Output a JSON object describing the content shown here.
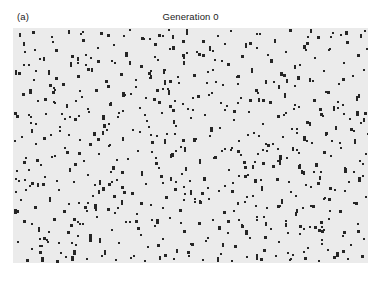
{
  "figure": {
    "width": 379,
    "height": 289,
    "page_background": "#ffffff"
  },
  "header": {
    "panel_label": "(a)",
    "title": "Generation 0"
  },
  "plot": {
    "background": "#ebebeb",
    "marker_color": "#262626",
    "left": 13,
    "top": 28,
    "width": 355,
    "height": 235,
    "border": "none"
  },
  "chart_data": {
    "type": "scatter",
    "title": "Generation 0",
    "subtitle": "(a)",
    "xlabel": "",
    "ylabel": "",
    "grid": false,
    "legend": null,
    "xlim": [
      0,
      355
    ],
    "ylim": [
      0,
      235
    ],
    "axis_visible": false,
    "tick_labels_x": [],
    "tick_labels_y": [],
    "marker": "square",
    "marker_size_px": 2.4,
    "marker_color": "#262626",
    "plot_background": "#ebebeb",
    "point_count": 648,
    "distribution": "uniform-random",
    "seed": 20240117,
    "points": [
      [
        7,
        6
      ],
      [
        20,
        4
      ],
      [
        39,
        9
      ],
      [
        56,
        3
      ],
      [
        70,
        12
      ],
      [
        88,
        5
      ],
      [
        101,
        17
      ],
      [
        117,
        2
      ],
      [
        131,
        11
      ],
      [
        146,
        7
      ],
      [
        160,
        19
      ],
      [
        174,
        4
      ],
      [
        190,
        13
      ],
      [
        205,
        8
      ],
      [
        218,
        3
      ],
      [
        233,
        16
      ],
      [
        247,
        6
      ],
      [
        262,
        12
      ],
      [
        277,
        2
      ],
      [
        291,
        18
      ],
      [
        305,
        9
      ],
      [
        320,
        5
      ],
      [
        334,
        14
      ],
      [
        348,
        7
      ],
      [
        352,
        3
      ],
      [
        12,
        24
      ],
      [
        27,
        31
      ],
      [
        43,
        22
      ],
      [
        58,
        35
      ],
      [
        73,
        27
      ],
      [
        85,
        20
      ],
      [
        99,
        33
      ],
      [
        113,
        25
      ],
      [
        128,
        38
      ],
      [
        142,
        29
      ],
      [
        157,
        21
      ],
      [
        171,
        34
      ],
      [
        186,
        26
      ],
      [
        200,
        23
      ],
      [
        215,
        36
      ],
      [
        229,
        28
      ],
      [
        244,
        20
      ],
      [
        258,
        32
      ],
      [
        273,
        24
      ],
      [
        287,
        37
      ],
      [
        302,
        30
      ],
      [
        316,
        22
      ],
      [
        331,
        35
      ],
      [
        345,
        27
      ],
      [
        354,
        21
      ],
      [
        6,
        45
      ],
      [
        21,
        52
      ],
      [
        36,
        43
      ],
      [
        50,
        56
      ],
      [
        65,
        48
      ],
      [
        79,
        41
      ],
      [
        94,
        54
      ],
      [
        108,
        46
      ],
      [
        123,
        59
      ],
      [
        137,
        50
      ],
      [
        152,
        42
      ],
      [
        166,
        55
      ],
      [
        181,
        47
      ],
      [
        195,
        44
      ],
      [
        210,
        57
      ],
      [
        224,
        49
      ],
      [
        239,
        41
      ],
      [
        253,
        53
      ],
      [
        268,
        45
      ],
      [
        282,
        58
      ],
      [
        297,
        51
      ],
      [
        311,
        43
      ],
      [
        326,
        56
      ],
      [
        340,
        48
      ],
      [
        351,
        42
      ],
      [
        10,
        66
      ],
      [
        25,
        73
      ],
      [
        40,
        64
      ],
      [
        54,
        77
      ],
      [
        69,
        69
      ],
      [
        83,
        62
      ],
      [
        98,
        75
      ],
      [
        112,
        67
      ],
      [
        127,
        80
      ],
      [
        141,
        71
      ],
      [
        156,
        63
      ],
      [
        170,
        76
      ],
      [
        185,
        68
      ],
      [
        199,
        65
      ],
      [
        214,
        78
      ],
      [
        228,
        70
      ],
      [
        243,
        62
      ],
      [
        257,
        74
      ],
      [
        272,
        66
      ],
      [
        286,
        79
      ],
      [
        301,
        72
      ],
      [
        315,
        64
      ],
      [
        330,
        77
      ],
      [
        344,
        69
      ],
      [
        356,
        63
      ],
      [
        4,
        88
      ],
      [
        18,
        95
      ],
      [
        33,
        86
      ],
      [
        47,
        99
      ],
      [
        62,
        91
      ],
      [
        76,
        84
      ],
      [
        91,
        97
      ],
      [
        105,
        89
      ],
      [
        120,
        102
      ],
      [
        134,
        93
      ],
      [
        149,
        85
      ],
      [
        163,
        98
      ],
      [
        178,
        90
      ],
      [
        192,
        87
      ],
      [
        207,
        100
      ],
      [
        221,
        92
      ],
      [
        236,
        84
      ],
      [
        250,
        96
      ],
      [
        265,
        88
      ],
      [
        279,
        101
      ],
      [
        294,
        94
      ],
      [
        308,
        86
      ],
      [
        323,
        99
      ],
      [
        337,
        91
      ],
      [
        352,
        85
      ],
      [
        9,
        109
      ],
      [
        23,
        116
      ],
      [
        38,
        107
      ],
      [
        52,
        120
      ],
      [
        67,
        112
      ],
      [
        81,
        105
      ],
      [
        96,
        118
      ],
      [
        110,
        110
      ],
      [
        125,
        123
      ],
      [
        139,
        114
      ],
      [
        154,
        106
      ],
      [
        168,
        119
      ],
      [
        183,
        111
      ],
      [
        197,
        108
      ],
      [
        212,
        121
      ],
      [
        226,
        113
      ],
      [
        241,
        105
      ],
      [
        255,
        117
      ],
      [
        270,
        109
      ],
      [
        284,
        122
      ],
      [
        299,
        115
      ],
      [
        313,
        107
      ],
      [
        328,
        120
      ],
      [
        342,
        112
      ],
      [
        355,
        106
      ],
      [
        13,
        130
      ],
      [
        28,
        137
      ],
      [
        42,
        128
      ],
      [
        57,
        141
      ],
      [
        71,
        133
      ],
      [
        86,
        126
      ],
      [
        100,
        139
      ],
      [
        115,
        131
      ],
      [
        129,
        144
      ],
      [
        144,
        135
      ],
      [
        158,
        127
      ],
      [
        173,
        140
      ],
      [
        187,
        132
      ],
      [
        202,
        129
      ],
      [
        216,
        142
      ],
      [
        231,
        134
      ],
      [
        245,
        126
      ],
      [
        260,
        138
      ],
      [
        274,
        130
      ],
      [
        289,
        143
      ],
      [
        303,
        136
      ],
      [
        318,
        128
      ],
      [
        332,
        141
      ],
      [
        347,
        133
      ],
      [
        357,
        127
      ],
      [
        3,
        151
      ],
      [
        17,
        158
      ],
      [
        32,
        149
      ],
      [
        46,
        162
      ],
      [
        61,
        154
      ],
      [
        75,
        147
      ],
      [
        90,
        160
      ],
      [
        104,
        152
      ],
      [
        119,
        165
      ],
      [
        133,
        156
      ],
      [
        148,
        148
      ],
      [
        162,
        161
      ],
      [
        177,
        153
      ],
      [
        191,
        150
      ],
      [
        206,
        163
      ],
      [
        220,
        155
      ],
      [
        235,
        147
      ],
      [
        249,
        159
      ],
      [
        264,
        151
      ],
      [
        278,
        164
      ],
      [
        293,
        157
      ],
      [
        307,
        149
      ],
      [
        322,
        162
      ],
      [
        336,
        154
      ],
      [
        350,
        148
      ],
      [
        8,
        172
      ],
      [
        22,
        179
      ],
      [
        37,
        170
      ],
      [
        51,
        183
      ],
      [
        66,
        175
      ],
      [
        80,
        168
      ],
      [
        95,
        181
      ],
      [
        109,
        173
      ],
      [
        124,
        186
      ],
      [
        138,
        177
      ],
      [
        153,
        169
      ],
      [
        167,
        182
      ],
      [
        182,
        174
      ],
      [
        196,
        171
      ],
      [
        211,
        184
      ],
      [
        225,
        176
      ],
      [
        240,
        168
      ],
      [
        254,
        180
      ],
      [
        269,
        172
      ],
      [
        283,
        185
      ],
      [
        298,
        178
      ],
      [
        312,
        170
      ],
      [
        327,
        183
      ],
      [
        341,
        175
      ],
      [
        353,
        169
      ],
      [
        11,
        193
      ],
      [
        26,
        200
      ],
      [
        41,
        191
      ],
      [
        55,
        204
      ],
      [
        70,
        196
      ],
      [
        84,
        189
      ],
      [
        99,
        202
      ],
      [
        113,
        194
      ],
      [
        128,
        207
      ],
      [
        142,
        198
      ],
      [
        157,
        190
      ],
      [
        171,
        203
      ],
      [
        186,
        195
      ],
      [
        200,
        192
      ],
      [
        215,
        205
      ],
      [
        229,
        197
      ],
      [
        244,
        189
      ],
      [
        258,
        201
      ],
      [
        273,
        193
      ],
      [
        287,
        206
      ],
      [
        302,
        199
      ],
      [
        316,
        191
      ],
      [
        331,
        204
      ],
      [
        345,
        196
      ],
      [
        356,
        190
      ],
      [
        5,
        214
      ],
      [
        19,
        221
      ],
      [
        34,
        212
      ],
      [
        48,
        225
      ],
      [
        63,
        217
      ],
      [
        77,
        210
      ],
      [
        92,
        223
      ],
      [
        106,
        215
      ],
      [
        121,
        228
      ],
      [
        135,
        219
      ],
      [
        150,
        211
      ],
      [
        164,
        224
      ],
      [
        179,
        216
      ],
      [
        193,
        213
      ],
      [
        208,
        226
      ],
      [
        222,
        218
      ],
      [
        237,
        210
      ],
      [
        251,
        222
      ],
      [
        266,
        214
      ],
      [
        280,
        227
      ],
      [
        295,
        220
      ],
      [
        309,
        212
      ],
      [
        324,
        225
      ],
      [
        338,
        217
      ],
      [
        351,
        211
      ],
      [
        14,
        232
      ],
      [
        29,
        230
      ],
      [
        44,
        233
      ],
      [
        59,
        229
      ],
      [
        74,
        231
      ],
      [
        89,
        228
      ],
      [
        103,
        232
      ],
      [
        118,
        230
      ],
      [
        132,
        233
      ],
      [
        147,
        229
      ],
      [
        161,
        231
      ],
      [
        176,
        228
      ],
      [
        190,
        232
      ],
      [
        205,
        230
      ],
      [
        219,
        233
      ],
      [
        234,
        229
      ],
      [
        248,
        231
      ],
      [
        263,
        228
      ],
      [
        277,
        232
      ],
      [
        292,
        230
      ],
      [
        306,
        233
      ],
      [
        321,
        229
      ],
      [
        335,
        231
      ],
      [
        349,
        228
      ]
    ]
  }
}
